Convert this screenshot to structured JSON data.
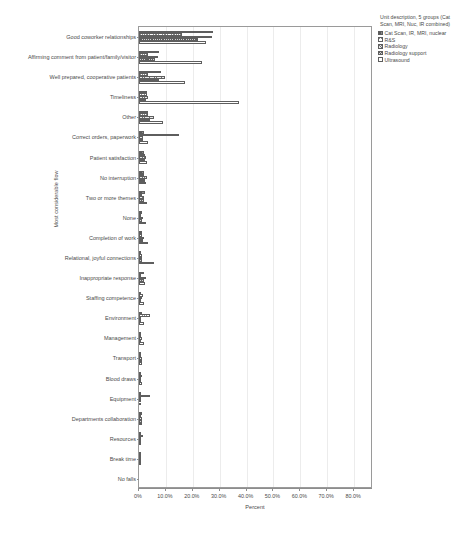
{
  "chart_data": {
    "type": "bar",
    "orientation": "horizontal",
    "grouped": true,
    "title": "",
    "xlabel": "Percent",
    "ylabel": "Most considerable flow",
    "xlim": [
      0,
      87
    ],
    "xticks": [
      0,
      10,
      20,
      30,
      40,
      50,
      60,
      70,
      80
    ],
    "xtick_labels": [
      "0%",
      "10.0%",
      "20.0%",
      "30.0%",
      "40.0%",
      "50.0%",
      "60.0%",
      "70.0%",
      "80.0%"
    ],
    "grid": "vertical",
    "legend_position": "right",
    "legend_title": "Unit description, 5 groups (Cat Scan, MRI, Nuc, IR combined)",
    "categories": [
      "Good coworker relationships",
      "Affirming comment from patient/family/visitor",
      "Well prepared, cooperative patients",
      "Timeliness",
      "Other",
      "Correct orders, paperwork",
      "Patient satisfaction",
      "No interruption",
      "Two or more themes",
      "None",
      "Completion of work",
      "Relational, joyful connections",
      "Inappropriate response",
      "Staffing competence",
      "Environment",
      "Management",
      "Transport",
      "Blood draws",
      "Equipment",
      "Departments collaboration",
      "Resources",
      "Break time",
      "No falls"
    ],
    "series": [
      {
        "name": "Cat Scan, IR, MRI, nuclear",
        "pattern": "dark-solid",
        "values": [
          27.5,
          7.5,
          8.0,
          3.0,
          3.5,
          1.8,
          2.0,
          2.0,
          2.2,
          1.0,
          1.2,
          0.8,
          1.8,
          0.8,
          1.0,
          0.6,
          0.8,
          0.6,
          0.4,
          1.0,
          0.3,
          0.2,
          0.0
        ]
      },
      {
        "name": "R&S",
        "pattern": "light-crosshatch",
        "values": [
          16.0,
          3.5,
          3.5,
          3.0,
          3.5,
          15.0,
          2.2,
          2.0,
          1.2,
          0.8,
          1.0,
          1.2,
          0.8,
          1.6,
          4.0,
          0.8,
          0.8,
          1.0,
          4.2,
          0.6,
          1.6,
          0.4,
          0.0
        ]
      },
      {
        "name": "Radiology",
        "pattern": "diagonal-hatch",
        "values": [
          27.0,
          7.0,
          9.5,
          3.2,
          5.5,
          1.6,
          2.6,
          2.8,
          2.0,
          1.4,
          2.0,
          1.2,
          2.6,
          1.0,
          0.8,
          1.0,
          1.2,
          0.8,
          0.6,
          1.2,
          0.4,
          0.2,
          0.0
        ]
      },
      {
        "name": "Radiology support",
        "pattern": "dense-crosshatch",
        "values": [
          22.0,
          6.0,
          7.5,
          2.6,
          4.0,
          1.4,
          2.2,
          2.4,
          1.8,
          1.0,
          1.6,
          1.0,
          2.0,
          0.8,
          0.8,
          0.8,
          1.0,
          0.8,
          0.4,
          1.0,
          0.3,
          0.2,
          0.0
        ]
      },
      {
        "name": "Ultrasound",
        "pattern": "white-empty",
        "values": [
          25.0,
          23.5,
          17.0,
          37.0,
          9.0,
          3.5,
          3.0,
          2.6,
          2.8,
          2.6,
          3.4,
          5.5,
          2.2,
          2.0,
          2.0,
          2.0,
          1.2,
          1.0,
          0.8,
          1.0,
          0.5,
          0.2,
          0.0
        ]
      }
    ]
  },
  "legend": {
    "title": "Unit description, 5 groups (Cat Scan, MRI, Nuc, IR combined)",
    "items": [
      {
        "label": "Cat Scan, IR, MRI, nuclear"
      },
      {
        "label": "R&S"
      },
      {
        "label": "Radiology"
      },
      {
        "label": "Radiology support"
      },
      {
        "label": "Ultrasound"
      }
    ]
  },
  "axes": {
    "x_title": "Percent",
    "y_title": "Most considerable flow"
  },
  "caption": ""
}
